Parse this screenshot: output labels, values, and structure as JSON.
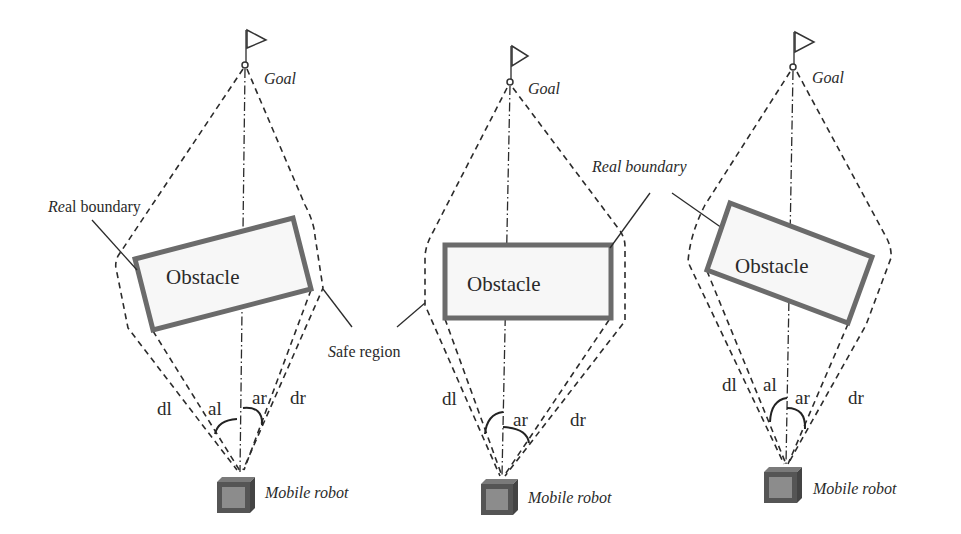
{
  "figure": {
    "type": "diagram",
    "description_panels": 3,
    "colors": {
      "line": "#2b2b2b",
      "obstacle_border": "#6b6b6b",
      "robot_body": "#555555",
      "robot_face": "#8c8c8c"
    },
    "annotations": {
      "real_boundary_left": {
        "italic_part": "Re",
        "regular_part": "al boundary"
      },
      "real_boundary_middle": {
        "text": "Real boundary"
      },
      "safe_region": {
        "italic_part": "S",
        "regular_part": "afe region"
      }
    },
    "panels": [
      {
        "goal_label": "Goal",
        "obstacle_label": "Obstacle",
        "robot_label": "Mobile robot",
        "labels": {
          "dl": "dl",
          "al": "al",
          "ar": "ar",
          "dr": "dr"
        }
      },
      {
        "goal_label": "Goal",
        "obstacle_label": "Obstacle",
        "robot_label": "Mobile robot",
        "labels": {
          "dl": "dl",
          "ar": "ar",
          "dr": "dr"
        }
      },
      {
        "goal_label": "Goal",
        "obstacle_label": "Obstacle",
        "robot_label": "Mobile robot",
        "labels": {
          "dl": "dl",
          "al": "al",
          "ar": "ar",
          "dr": "dr"
        }
      }
    ]
  }
}
